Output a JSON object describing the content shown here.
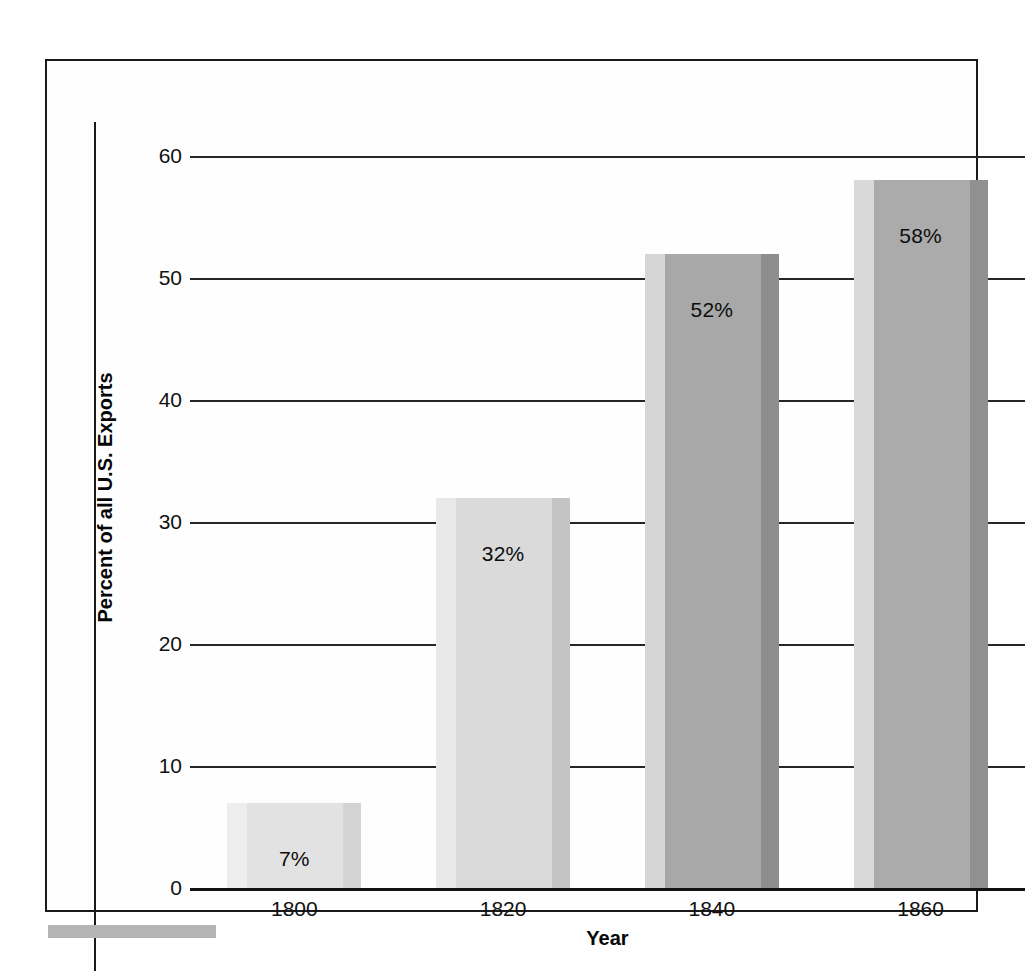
{
  "figure": {
    "background_color": "#ffffff",
    "frame_color": "#1a1a1a",
    "artifact_color": "#b4b4b4"
  },
  "chart_data": {
    "type": "bar",
    "title": "",
    "subtitle": "",
    "xlabel": "Year",
    "ylabel": "Percent of all U.S. Exports",
    "categories": [
      "1800",
      "1820",
      "1840",
      "1860"
    ],
    "values": [
      7,
      32,
      52,
      58
    ],
    "data_labels": [
      "7%",
      "32%",
      "52%",
      "58%"
    ],
    "ylim": [
      0,
      60
    ],
    "yticks": [
      0,
      10,
      20,
      30,
      40,
      50,
      60
    ],
    "ytick_labels": [
      "0",
      "10",
      "20",
      "30",
      "40",
      "50",
      "60"
    ],
    "grid": "horizontal",
    "legend": "none",
    "bar_colors": [
      "#e2e2e2",
      "#dadada",
      "#a8a8a8",
      "#ababab"
    ],
    "bar_edge_left_colors": [
      "#ededed",
      "#e9e9e9",
      "#d6d6d6",
      "#d9d9d9"
    ],
    "bar_edge_right_colors": [
      "#d4d4d4",
      "#c4c4c4",
      "#8e8e8e",
      "#909090"
    ]
  },
  "axis": {
    "y_title": "Percent of all U.S. Exports",
    "x_title": "Year"
  }
}
